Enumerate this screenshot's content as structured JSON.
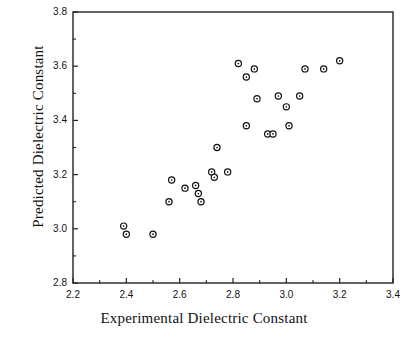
{
  "chart_data": {
    "type": "scatter",
    "title": "",
    "xlabel": "Experimental Dielectric Constant",
    "ylabel": "Predicted Dielectric Constant",
    "xlim": [
      2.2,
      3.4
    ],
    "ylim": [
      2.8,
      3.8
    ],
    "xticks": [
      2.2,
      2.4,
      2.6,
      2.8,
      3.0,
      3.2,
      3.4
    ],
    "xticklabels": [
      "2.2",
      "2.4",
      "2.6",
      "2.8",
      "3.0",
      "3.2",
      "3.4"
    ],
    "yticks": [
      2.8,
      3.0,
      3.2,
      3.4,
      3.6,
      3.8
    ],
    "yticklabels": [
      "2.8",
      "3.0",
      "3.2",
      "3.4",
      "3.6",
      "3.8"
    ],
    "minor_ticks": true,
    "grid": false,
    "legend": null,
    "marker": "open-circle",
    "marker_color": "#111111",
    "points": [
      {
        "x": 2.39,
        "y": 3.01
      },
      {
        "x": 2.4,
        "y": 2.98
      },
      {
        "x": 2.5,
        "y": 2.98
      },
      {
        "x": 2.56,
        "y": 3.1
      },
      {
        "x": 2.57,
        "y": 3.18
      },
      {
        "x": 2.62,
        "y": 3.15
      },
      {
        "x": 2.66,
        "y": 3.16
      },
      {
        "x": 2.67,
        "y": 3.13
      },
      {
        "x": 2.68,
        "y": 3.1
      },
      {
        "x": 2.72,
        "y": 3.21
      },
      {
        "x": 2.73,
        "y": 3.19
      },
      {
        "x": 2.74,
        "y": 3.3
      },
      {
        "x": 2.78,
        "y": 3.21
      },
      {
        "x": 2.82,
        "y": 3.61
      },
      {
        "x": 2.85,
        "y": 3.56
      },
      {
        "x": 2.85,
        "y": 3.38
      },
      {
        "x": 2.88,
        "y": 3.59
      },
      {
        "x": 2.89,
        "y": 3.48
      },
      {
        "x": 2.93,
        "y": 3.35
      },
      {
        "x": 2.95,
        "y": 3.35
      },
      {
        "x": 2.97,
        "y": 3.49
      },
      {
        "x": 3.0,
        "y": 3.45
      },
      {
        "x": 3.01,
        "y": 3.38
      },
      {
        "x": 3.05,
        "y": 3.49
      },
      {
        "x": 3.07,
        "y": 3.59
      },
      {
        "x": 3.14,
        "y": 3.59
      },
      {
        "x": 3.2,
        "y": 3.62
      }
    ]
  }
}
